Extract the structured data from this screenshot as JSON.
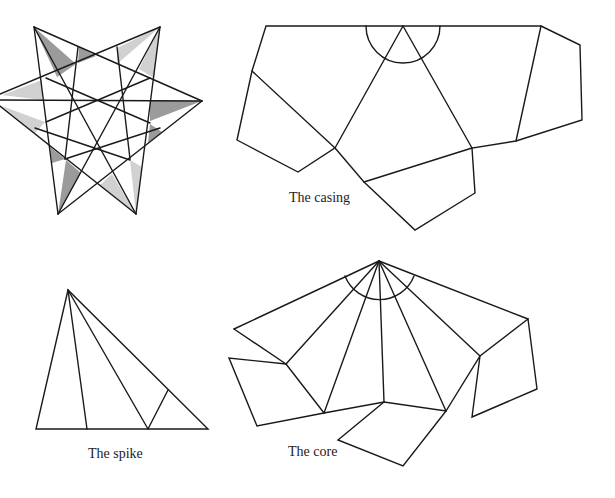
{
  "figure": {
    "star": {
      "name": "Assembled stellated solid (top view)"
    },
    "casing": {
      "label": "The casing"
    },
    "spike": {
      "label": "The spike"
    },
    "core": {
      "label": "The core"
    }
  }
}
